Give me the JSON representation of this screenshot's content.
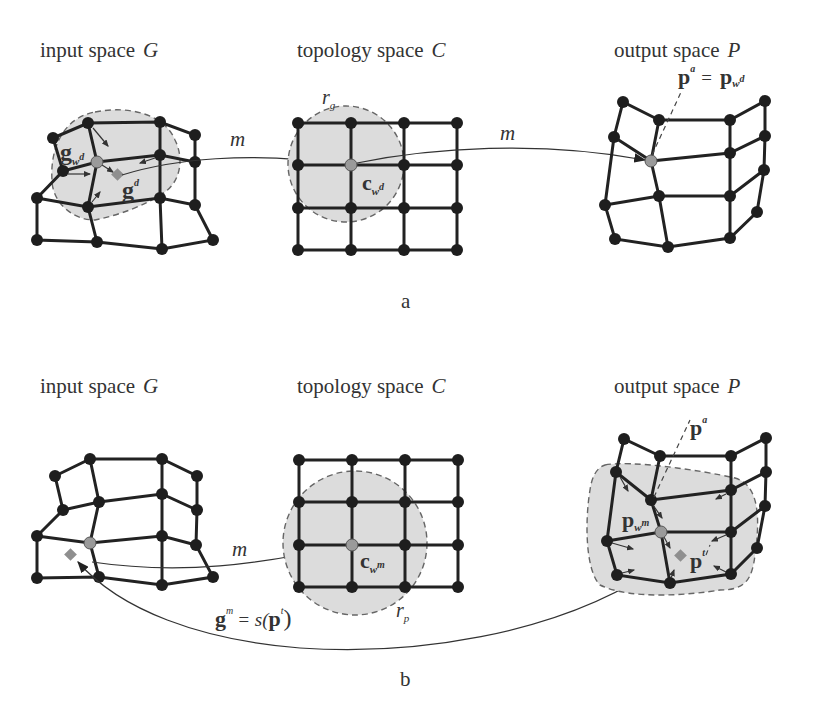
{
  "figure": {
    "panel_a": {
      "caption": "a",
      "titles": {
        "input": {
          "text": "input space",
          "var": "G"
        },
        "topology": {
          "text": "topology space",
          "var": "C"
        },
        "output": {
          "text": "output space",
          "var": "P"
        }
      },
      "mapping_labels": [
        "m",
        "m"
      ],
      "labels": {
        "g_wd": {
          "base": "g",
          "sub": "w",
          "subsup": "d"
        },
        "g_d": {
          "base": "g",
          "sup": "d"
        },
        "r_g": {
          "base": "r",
          "sub": "g"
        },
        "c_wd": {
          "base": "c",
          "sub": "w",
          "subsup": "d"
        },
        "p_a_eq": {
          "lhs": "p",
          "lhs_sup": "a",
          "eq": "=",
          "rhs": "p",
          "rhs_sub": "w",
          "rhs_subsup": "d"
        }
      }
    },
    "panel_b": {
      "caption": "b",
      "titles": {
        "input": {
          "text": "input space",
          "var": "G"
        },
        "topology": {
          "text": "topology space",
          "var": "C"
        },
        "output": {
          "text": "output space",
          "var": "P"
        }
      },
      "mapping_labels": [
        "m"
      ],
      "labels": {
        "p_a": {
          "base": "p",
          "sup": "a"
        },
        "p_wm": {
          "base": "p",
          "sub": "w",
          "subsup": "m"
        },
        "p_t": {
          "base": "p",
          "sup": "t"
        },
        "c_wm": {
          "base": "c",
          "sub": "w",
          "subsup": "m"
        },
        "r_p": {
          "base": "r",
          "sub": "p"
        },
        "g_m_eq": {
          "lhs": "g",
          "lhs_sup": "m",
          "eq": "= s(",
          "arg": "p",
          "arg_sup": "t",
          "close": ")"
        }
      }
    },
    "colors": {
      "node": "#1e1e1e",
      "winner_node": "#9a9a9a",
      "sample_diamond": "#8f8f8f",
      "neighborhood_fill": "#dcdcdc",
      "edge": "#222222"
    }
  }
}
